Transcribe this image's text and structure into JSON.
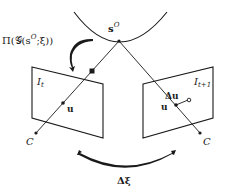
{
  "diagram": {
    "type": "camera-projection-geometry",
    "colors": {
      "ink": "#1a1a1a",
      "background": "#ffffff"
    },
    "labels": {
      "surface_point": "s",
      "surface_point_superscript": "O",
      "projection": "Π(𝒢(s",
      "projection_sup": "O",
      "projection_tail": ";ξ))",
      "frame_t": "I",
      "frame_t_sub": "t",
      "frame_t1": "I",
      "frame_t1_sub": "t+1",
      "pixel_left": "u",
      "pixel_right": "u",
      "flow": "Δu",
      "camera_left": "C",
      "camera_right": "C",
      "pose_change": "Δξ"
    },
    "elements": {
      "surface_arc": "object surface (curved)",
      "image_plane_left": "image plane at time t",
      "image_plane_right": "image plane at time t+1",
      "ray_left": "ray from camera center C through u to s^O",
      "ray_right": "ray from camera center C through u to s^O",
      "projection_arrow": "curved arrow indicating projection",
      "motion_arrow": "curved arrow indicating camera motion"
    }
  }
}
